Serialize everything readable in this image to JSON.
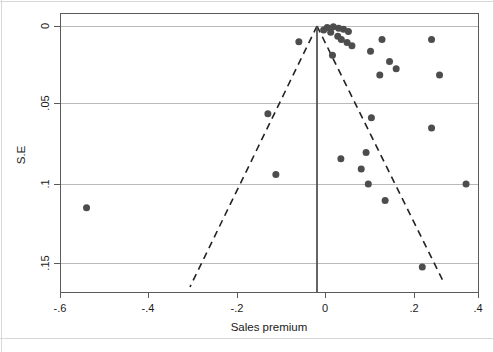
{
  "figure": {
    "kind": "funnel-plot",
    "background_color": "#ffffff",
    "point_color": "#4d4d4d",
    "grid_color": "#b9b9b9",
    "frame_color": "#5a5a5a",
    "funnel_line_color": "#232323",
    "reference_line_color": "#4b4b4b"
  },
  "chart_data": {
    "type": "scatter",
    "title": "",
    "subtitle": "",
    "xlabel": "Sales premium",
    "ylabel": "S.E",
    "xlim": [
      -0.7,
      0.45
    ],
    "ylim": [
      0.167,
      -0.004
    ],
    "y_inverted": true,
    "grid": true,
    "legend": false,
    "legend_position": "none",
    "xticks": [
      -0.6,
      -0.4,
      -0.2,
      0,
      0.2,
      0.4
    ],
    "xticklabels": [
      "-.6",
      "-.4",
      "-.2",
      "0",
      ".2",
      ".4"
    ],
    "yticks": [
      0,
      0.05,
      0.1,
      0.15
    ],
    "yticklabels": [
      "0",
      ".05",
      ".1",
      ".15"
    ],
    "reference_line": {
      "orientation": "vertical",
      "x": 0.018,
      "style": "solid",
      "label": "pooled effect"
    },
    "funnel_bounds": {
      "style": "dashed",
      "apex": [
        0.018,
        0.0
      ],
      "left_end": [
        -0.287,
        0.165
      ],
      "right_end": [
        0.285,
        0.161
      ]
    },
    "series": [
      {
        "name": "Studies",
        "marker": "circle",
        "points": [
          [
            0.018,
            0.0005
          ],
          [
            0.004,
            0.001
          ],
          [
            -0.004,
            0.0025
          ],
          [
            0.03,
            0.0015
          ],
          [
            0.041,
            0.002
          ],
          [
            0.052,
            0.0035
          ],
          [
            0.012,
            0.004
          ],
          [
            0.028,
            0.0065
          ],
          [
            0.036,
            0.0085
          ],
          [
            0.049,
            0.0105
          ],
          [
            0.06,
            0.0125
          ],
          [
            -0.06,
            0.01
          ],
          [
            0.128,
            0.0085
          ],
          [
            0.24,
            0.0085
          ],
          [
            0.102,
            0.016
          ],
          [
            0.016,
            0.0185
          ],
          [
            0.145,
            0.0225
          ],
          [
            0.16,
            0.027
          ],
          [
            0.123,
            0.031
          ],
          [
            0.258,
            0.031
          ],
          [
            -0.13,
            0.0555
          ],
          [
            0.104,
            0.058
          ],
          [
            0.24,
            0.0645
          ],
          [
            0.035,
            0.084
          ],
          [
            0.092,
            0.08
          ],
          [
            -0.112,
            0.094
          ],
          [
            0.081,
            0.0905
          ],
          [
            0.097,
            0.1
          ],
          [
            0.318,
            0.1
          ],
          [
            -0.54,
            0.115
          ],
          [
            0.135,
            0.1105
          ],
          [
            0.219,
            0.1525
          ]
        ]
      }
    ],
    "n_points": 32
  }
}
